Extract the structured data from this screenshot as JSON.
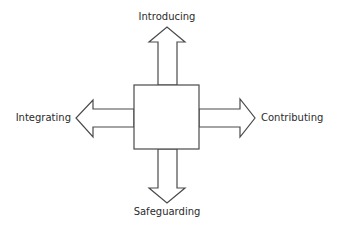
{
  "diagram": {
    "center_box": {
      "label": ""
    },
    "arrows": {
      "up": {
        "label": "Introducing"
      },
      "down": {
        "label": "Safeguarding"
      },
      "left": {
        "label": "Integrating"
      },
      "right": {
        "label": "Contributing"
      }
    },
    "colors": {
      "stroke": "#4a4a4a",
      "fill": "#ffffff",
      "text": "#2b2b2b"
    }
  }
}
